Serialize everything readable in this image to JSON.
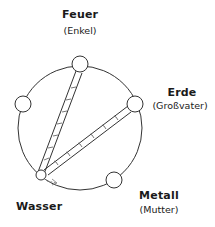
{
  "diagram": {
    "type": "five-elements-cycle",
    "elements": [
      {
        "name": "Feuer",
        "role": "(Enkel)"
      },
      {
        "name": "Erde",
        "role": "(Großvater)"
      },
      {
        "name": "Metall",
        "role": "(Mutter)"
      },
      {
        "name": "Wasser",
        "role": ""
      },
      {
        "name": "",
        "role": ""
      }
    ],
    "colors": {
      "stroke": "#333333",
      "background": "#ffffff"
    }
  }
}
